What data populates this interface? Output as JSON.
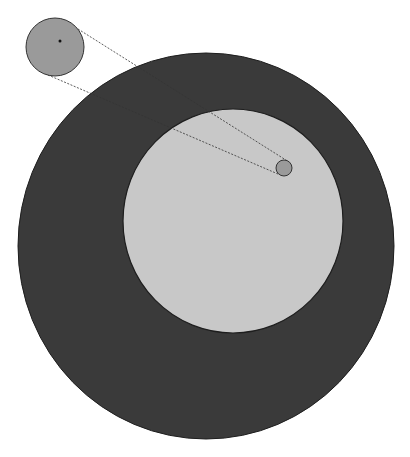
{
  "diagram": {
    "background": "#ffffff",
    "outer_disk": {
      "cx": 206,
      "cy": 246,
      "rx": 188,
      "ry": 193,
      "fill": "#3a3a3a",
      "stroke": "#1e1e1e"
    },
    "inner_disk": {
      "cx": 233,
      "cy": 221,
      "rx": 110,
      "ry": 112,
      "fill": "#c8c8c8",
      "stroke": "#1e1e1e"
    },
    "small_circle": {
      "cx": 284,
      "cy": 168,
      "r": 8,
      "fill": "#9a9a9a",
      "stroke": "#333333"
    },
    "magnified_circle": {
      "cx": 55,
      "cy": 47,
      "r": 29,
      "fill": "#9a9a9a",
      "stroke": "#333333"
    },
    "center_dot": {
      "cx": 60,
      "cy": 41,
      "r": 1.5,
      "fill": "#111111"
    },
    "connector_lines": [
      {
        "x1": 78,
        "y1": 29,
        "x2": 289,
        "y2": 162
      },
      {
        "x1": 48,
        "y1": 75,
        "x2": 278,
        "y2": 174
      }
    ],
    "line_color": "#333333"
  }
}
